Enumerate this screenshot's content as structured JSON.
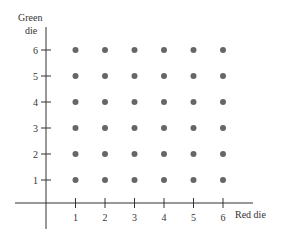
{
  "chart_data": {
    "type": "scatter",
    "title": "",
    "xlabel": "Red die",
    "ylabel_lines": [
      "Green",
      "die"
    ],
    "x_ticks": [
      "1",
      "2",
      "3",
      "4",
      "5",
      "6"
    ],
    "y_ticks": [
      "1",
      "2",
      "3",
      "4",
      "5",
      "6"
    ],
    "xlim": [
      0,
      6.7
    ],
    "ylim": [
      -0.9,
      6.9
    ],
    "grid": false,
    "legend": "none",
    "points": [
      [
        1,
        1
      ],
      [
        2,
        1
      ],
      [
        3,
        1
      ],
      [
        4,
        1
      ],
      [
        5,
        1
      ],
      [
        6,
        1
      ],
      [
        1,
        2
      ],
      [
        2,
        2
      ],
      [
        3,
        2
      ],
      [
        4,
        2
      ],
      [
        5,
        2
      ],
      [
        6,
        2
      ],
      [
        1,
        3
      ],
      [
        2,
        3
      ],
      [
        3,
        3
      ],
      [
        4,
        3
      ],
      [
        5,
        3
      ],
      [
        6,
        3
      ],
      [
        1,
        4
      ],
      [
        2,
        4
      ],
      [
        3,
        4
      ],
      [
        4,
        4
      ],
      [
        5,
        4
      ],
      [
        6,
        4
      ],
      [
        1,
        5
      ],
      [
        2,
        5
      ],
      [
        3,
        5
      ],
      [
        4,
        5
      ],
      [
        5,
        5
      ],
      [
        6,
        5
      ],
      [
        1,
        6
      ],
      [
        2,
        6
      ],
      [
        3,
        6
      ],
      [
        4,
        6
      ],
      [
        5,
        6
      ],
      [
        6,
        6
      ]
    ],
    "point_color": "#666666"
  }
}
